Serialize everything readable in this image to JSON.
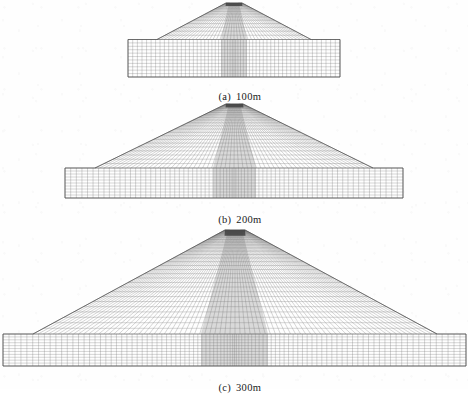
{
  "figure": {
    "kind": "finite-element-mesh-cross-sections",
    "background_color": "#fefefe",
    "mesh_line_color": "#6b6b6b",
    "mesh_line_color_light": "#9a9a9a",
    "core_fill_color": "#b9b9b9",
    "crest_fill_color": "#3a3a3a",
    "outline_color": "#4a4a4a",
    "caption_color": "#1a1a1a"
  },
  "panels": [
    {
      "id": "panel-a",
      "caption_label": "(a)",
      "caption_value": "100m",
      "height_m": 100,
      "geometry": {
        "found_left": 128,
        "found_right": 340,
        "found_top": 39.5,
        "found_bottom": 77,
        "crest_left": 226,
        "crest_right": 242,
        "crest_top": 3,
        "toe_left": 157,
        "toe_right": 311,
        "core_top_left": 229,
        "core_top_right": 239,
        "core_bot_left": 221,
        "core_bot_right": 247
      },
      "mesh": {
        "embankment_cols": 44,
        "embankment_rows": 13,
        "foundation_cols": 56,
        "foundation_rows": 11
      }
    },
    {
      "id": "panel-b",
      "caption_label": "(b)",
      "caption_value": "200m",
      "height_m": 200,
      "geometry": {
        "found_left": 65,
        "found_right": 403,
        "found_top": 168,
        "found_bottom": 198,
        "crest_left": 226,
        "crest_right": 243,
        "crest_top": 104,
        "toe_left": 95,
        "toe_right": 373,
        "core_top_left": 229,
        "core_top_right": 240,
        "core_bot_left": 213,
        "core_bot_right": 256
      },
      "mesh": {
        "embankment_cols": 62,
        "embankment_rows": 22,
        "foundation_cols": 74,
        "foundation_rows": 10
      }
    },
    {
      "id": "panel-c",
      "caption_label": "(c)",
      "caption_value": "300m",
      "height_m": 300,
      "geometry": {
        "found_left": 3,
        "found_right": 466,
        "found_top": 334,
        "found_bottom": 366,
        "crest_left": 225,
        "crest_right": 245,
        "crest_top": 230,
        "toe_left": 33,
        "toe_right": 437,
        "core_top_left": 228,
        "core_top_right": 242,
        "core_bot_left": 201,
        "core_bot_right": 268
      },
      "mesh": {
        "embankment_cols": 80,
        "embankment_rows": 28,
        "foundation_cols": 96,
        "foundation_rows": 11
      }
    }
  ]
}
